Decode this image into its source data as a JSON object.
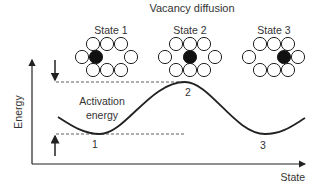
{
  "title": "Vacancy diffusion",
  "axes": {
    "y_label": "Energy",
    "x_label": "State"
  },
  "states": [
    {
      "label": "State 1",
      "black_atom_position": "middle-left",
      "vacancy_position": "middle-right"
    },
    {
      "label": "State 2",
      "black_atom_position": "center",
      "vacancy_position": "split"
    },
    {
      "label": "State 3",
      "black_atom_position": "middle-right",
      "vacancy_position": "middle-left"
    }
  ],
  "curve_points": {
    "p1": "1",
    "p2": "2",
    "p3": "3"
  },
  "annotation": {
    "line1": "Activation",
    "line2": "energy"
  },
  "colors": {
    "ink": "#222222",
    "atom_fill": "#ffffff",
    "diffusing_atom": "#111111"
  }
}
